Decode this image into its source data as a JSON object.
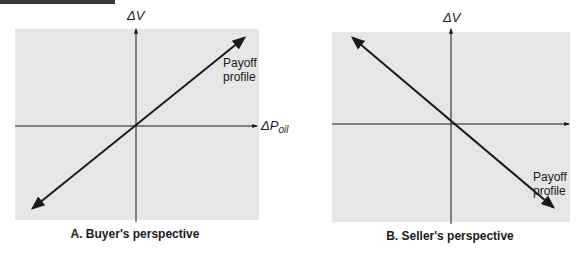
{
  "figure": {
    "panels": [
      {
        "id": "A",
        "caption": "A. Buyer's perspective",
        "y_axis_label": "ΔV",
        "x_axis_label_main": "ΔP",
        "x_axis_label_sub": "oil",
        "curve_label_line1": "Payoff",
        "curve_label_line2": "profile",
        "slope": "positive"
      },
      {
        "id": "B",
        "caption": "B. Seller's perspective",
        "y_axis_label": "ΔV",
        "curve_label_line1": "Payoff",
        "curve_label_line2": "profile",
        "slope": "negative"
      }
    ],
    "colors": {
      "panel_background": "#e6e6e6",
      "line": "#1a1a1a",
      "page_background": "#ffffff"
    }
  }
}
